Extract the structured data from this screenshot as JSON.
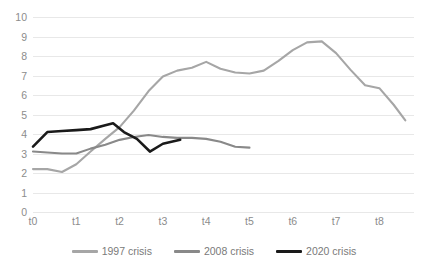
{
  "chart_data": {
    "type": "line",
    "title": "",
    "subtitle": "",
    "xlabel": "",
    "ylabel": "",
    "xlim": [
      0,
      8.8
    ],
    "ylim": [
      0,
      10
    ],
    "grid": true,
    "grid_axis": "y",
    "legend_position": "bottom",
    "categories": [
      "t0",
      "t1",
      "t2",
      "t3",
      "t4",
      "t5",
      "t6",
      "t7",
      "t8"
    ],
    "x_tick_labels": [
      "t0",
      "t1",
      "t2",
      "t3",
      "t4",
      "t5",
      "t6",
      "t7",
      "t8"
    ],
    "x_tick_values": [
      0,
      1,
      2,
      3,
      4,
      5,
      6,
      7,
      8
    ],
    "y_tick_labels": [
      "0",
      "1",
      "2",
      "3",
      "4",
      "5",
      "6",
      "7",
      "8",
      "9",
      "10"
    ],
    "y_tick_values": [
      0,
      1,
      2,
      3,
      4,
      5,
      6,
      7,
      8,
      9,
      10
    ],
    "series": [
      {
        "name": "1997 crisis",
        "color": "#a6a6a6",
        "x": [
          0,
          0.33,
          0.67,
          1.0,
          1.33,
          1.67,
          2.0,
          2.33,
          2.67,
          3.0,
          3.33,
          3.67,
          4.0,
          4.33,
          4.67,
          5.0,
          5.33,
          5.67,
          6.0,
          6.33,
          6.67,
          7.0,
          7.33,
          7.67,
          8.0,
          8.33,
          8.6
        ],
        "values": [
          2.2,
          2.2,
          2.05,
          2.45,
          3.1,
          3.75,
          4.35,
          5.2,
          6.2,
          6.95,
          7.25,
          7.4,
          7.7,
          7.35,
          7.15,
          7.1,
          7.25,
          7.75,
          8.3,
          8.7,
          8.75,
          8.15,
          7.3,
          6.5,
          6.35,
          5.5,
          4.7
        ]
      },
      {
        "name": "2008 crisis",
        "color": "#898989",
        "x": [
          0,
          0.33,
          0.67,
          1.0,
          1.33,
          1.67,
          2.0,
          2.33,
          2.67,
          3.0,
          3.33,
          3.67,
          4.0,
          4.33,
          4.67,
          5.0
        ],
        "values": [
          3.1,
          3.05,
          3.0,
          3.0,
          3.25,
          3.45,
          3.7,
          3.85,
          3.95,
          3.85,
          3.8,
          3.8,
          3.75,
          3.6,
          3.35,
          3.3
        ]
      },
      {
        "name": "2020 crisis",
        "color": "#1a1a1a",
        "x": [
          0,
          0.33,
          0.67,
          1.0,
          1.33,
          1.67,
          1.85,
          2.1,
          2.4,
          2.7,
          3.0,
          3.4
        ],
        "values": [
          3.35,
          4.1,
          4.15,
          4.2,
          4.25,
          4.45,
          4.55,
          4.1,
          3.75,
          3.1,
          3.5,
          3.7
        ]
      }
    ]
  },
  "legend": {
    "items": [
      {
        "label": "1997 crisis",
        "color": "#a6a6a6"
      },
      {
        "label": "2008 crisis",
        "color": "#898989"
      },
      {
        "label": "2020 crisis",
        "color": "#1a1a1a"
      }
    ]
  },
  "colors": {
    "background": "#ffffff",
    "gridline": "#e8e8e8",
    "tick_text": "#8c8c8c",
    "legend_text": "#7a7a7a"
  }
}
